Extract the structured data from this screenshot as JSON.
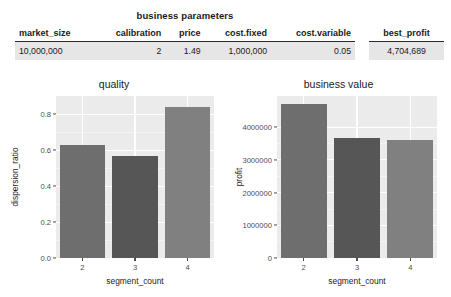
{
  "table": {
    "title": "business parameters",
    "params": {
      "headers": [
        "market_size",
        "calibration",
        "price",
        "cost.fixed",
        "cost.variable"
      ],
      "row": [
        "10,000,000",
        "2",
        "1.49",
        "1,000,000",
        "0.05"
      ]
    },
    "best": {
      "headers": [
        "best_profit"
      ],
      "row": [
        "4,704,689"
      ]
    }
  },
  "colors": {
    "panel_bg": "#ebebeb",
    "gridline": "#ffffff",
    "bar_segment_2": "#6e6e6e",
    "bar_segment_3": "#565656",
    "bar_segment_4": "#808080",
    "axis_text": "#4d4d4d",
    "table_row_bg": "#e6e6e6",
    "text": "#1a1a1a"
  },
  "chart_data": [
    {
      "type": "bar",
      "id": "quality",
      "title": "quality",
      "xlabel": "segment_count",
      "ylabel": "dispersion_ratio",
      "categories": [
        "2",
        "3",
        "4"
      ],
      "values": [
        0.63,
        0.565,
        0.84
      ],
      "ylim": [
        0.0,
        0.9
      ],
      "yticks": [
        0.0,
        0.2,
        0.4,
        0.6,
        0.8
      ],
      "ytick_labels": [
        "0.0",
        "0.2",
        "0.4",
        "0.6",
        "0.8"
      ],
      "grid": true,
      "legend": "none",
      "bar_colors": [
        "#6e6e6e",
        "#565656",
        "#808080"
      ]
    },
    {
      "type": "bar",
      "id": "business-value",
      "title": "business value",
      "xlabel": "segment_count",
      "ylabel": "profit",
      "categories": [
        "2",
        "3",
        "4"
      ],
      "values": [
        4704689,
        3680000,
        3600000
      ],
      "ylim": [
        0,
        4950000
      ],
      "yticks": [
        0,
        1000000,
        2000000,
        3000000,
        4000000
      ],
      "ytick_labels": [
        "0",
        "1000000",
        "2000000",
        "3000000",
        "4000000"
      ],
      "grid": true,
      "legend": "none",
      "bar_colors": [
        "#6e6e6e",
        "#565656",
        "#808080"
      ]
    }
  ]
}
